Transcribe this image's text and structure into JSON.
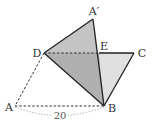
{
  "diagram": {
    "type": "geometry-fold",
    "points": {
      "A_prime": {
        "label": "A′",
        "x": 93,
        "y": 19
      },
      "D": {
        "label": "D",
        "x": 44,
        "y": 53
      },
      "E": {
        "label": "E",
        "x": 99,
        "y": 53
      },
      "C": {
        "label": "C",
        "x": 134,
        "y": 53
      },
      "A": {
        "label": "A",
        "x": 15,
        "y": 106
      },
      "B": {
        "label": "B",
        "x": 104,
        "y": 106
      }
    },
    "measure": {
      "label": "20",
      "segment": "AB"
    },
    "colors": {
      "stroke": "#222222",
      "dark_fill": "#b8b8b8",
      "light_fill": "#dcdcdc",
      "dashed": "#333333",
      "arc": "#999999"
    }
  }
}
